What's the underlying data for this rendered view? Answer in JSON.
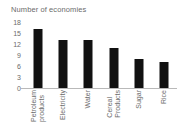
{
  "chart_data": {
    "type": "bar",
    "title": "Number of economies",
    "xlabel": "",
    "ylabel": "",
    "categories": [
      "Petroleum products",
      "Electricity",
      "Water",
      "Cereal Products",
      "Sugar",
      "Rice"
    ],
    "category_lines": [
      [
        "Petroleum",
        "products"
      ],
      [
        "Electricity",
        ""
      ],
      [
        "Water",
        ""
      ],
      [
        "Cereal",
        "Products"
      ],
      [
        "Sugar",
        ""
      ],
      [
        "Rice",
        ""
      ]
    ],
    "values": [
      16,
      13,
      13,
      11,
      8,
      7
    ],
    "ylim": [
      0,
      18
    ],
    "yticks": [
      18,
      15,
      12,
      9,
      6,
      3,
      0
    ],
    "ytick_labels": [
      "18",
      "15",
      "12",
      "9",
      "6",
      "3",
      "0"
    ],
    "grid": false,
    "legend": false,
    "bar_color": "#111111",
    "text_color": "#6b6b6b",
    "axis_color": "#b9b9b9",
    "background": "#ffffff"
  }
}
